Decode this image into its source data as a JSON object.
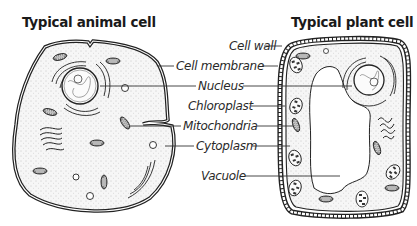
{
  "titles": {
    "animal": "Typical animal cell",
    "plant": "Typical plant cell"
  },
  "labels": [
    {
      "id": "cell-wall",
      "text": "Cell wall",
      "x": 229,
      "y": 39,
      "anchor_end": 264,
      "line_to_left": null,
      "line_to_right": 282
    },
    {
      "id": "cell-membrane",
      "text": "Cell membrane",
      "x": 176,
      "y": 59,
      "anchor_end": 262,
      "line_to_left": 158,
      "line_to_right": 278
    },
    {
      "id": "nucleus",
      "text": "Nucleus",
      "x": 198,
      "y": 79,
      "anchor_end": 243,
      "line_to_left": 100,
      "line_to_right": 352
    },
    {
      "id": "chloroplast",
      "text": "Chloroplast",
      "x": 188,
      "y": 99,
      "anchor_end": 251,
      "line_to_left": null,
      "line_to_right": 285
    },
    {
      "id": "mitochondria",
      "text": "Mitochondria",
      "x": 183,
      "y": 119,
      "anchor_end": 257,
      "line_to_left": 130,
      "line_to_right": 293
    },
    {
      "id": "cytoplasm",
      "text": "Cytoplasm",
      "x": 196,
      "y": 139,
      "anchor_end": 252,
      "line_to_left": 165,
      "line_to_right": 290
    },
    {
      "id": "vacuole",
      "text": "Vacuole",
      "x": 201,
      "y": 169,
      "anchor_end": 245,
      "line_to_left": null,
      "line_to_right": 340
    }
  ],
  "colors": {
    "ink": "#222222",
    "cytoplasm_fill": "#f4f4f4",
    "organelle_fill": "#7a7a7a",
    "background": "#ffffff"
  }
}
